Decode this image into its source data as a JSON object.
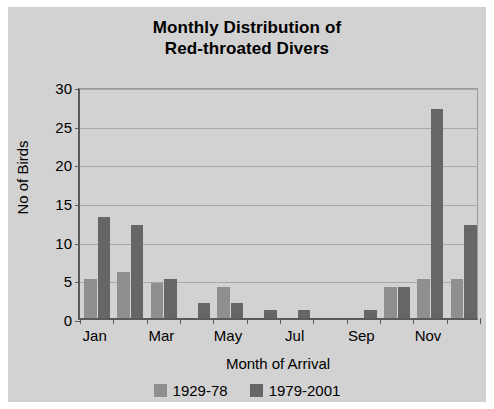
{
  "chart_data": {
    "type": "bar",
    "title": "Monthly Distribution of Red-throated Divers",
    "title_line1": "Monthly Distribution of",
    "title_line2": "Red-throated Divers",
    "xlabel": "Month of Arrival",
    "ylabel": "No of Birds",
    "ylim": [
      0,
      30
    ],
    "yticks": [
      0,
      5,
      10,
      15,
      20,
      25,
      30
    ],
    "grid": true,
    "legend_position": "bottom",
    "categories": [
      "Jan",
      "Feb",
      "Mar",
      "Apr",
      "May",
      "Jun",
      "Jul",
      "Aug",
      "Sep",
      "Oct",
      "Nov",
      "Dec"
    ],
    "xtick_labels": [
      "Jan",
      "Mar",
      "May",
      "Jul",
      "Sep",
      "Nov"
    ],
    "series": [
      {
        "name": "1929-78",
        "color": "#8f8f8f",
        "values": [
          5,
          6,
          4.5,
          0,
          4,
          0,
          0,
          0,
          0,
          4,
          5,
          5
        ]
      },
      {
        "name": "1979-2001",
        "color": "#666666",
        "values": [
          13,
          12,
          5,
          2,
          2,
          1,
          1,
          0,
          1,
          4,
          27,
          12
        ]
      }
    ]
  },
  "style": {
    "background": "#d2d2d2",
    "axis_color": "#5a5a5a",
    "gridline_color": "#a8a8a8"
  }
}
